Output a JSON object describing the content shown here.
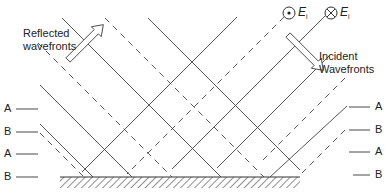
{
  "labels": {
    "reflected_line1": "Reflected",
    "reflected_line2": "wavefronts",
    "incident_line1": "Incident",
    "incident_line2": "Wavefronts",
    "field_out": "E",
    "field_in": "E",
    "field_sub": "i"
  },
  "left_markers": [
    "A",
    "B",
    "A",
    "B"
  ],
  "right_markers": [
    "A",
    "B",
    "A",
    "B"
  ],
  "colors": {
    "line": "#333333",
    "text": "#222222"
  }
}
